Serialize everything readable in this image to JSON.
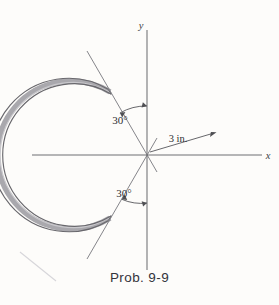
{
  "figure": {
    "caption": "Prob. 9-9",
    "background_color": "#fdfcfa",
    "axes": {
      "x_label": "x",
      "y_label": "y",
      "axis_color": "#6f6f72",
      "origin": {
        "x": 147,
        "y": 155
      }
    },
    "ring": {
      "radius_label": "3 in.",
      "radius_value": 3,
      "radius_units": "in.",
      "band_color": "#a9a8ad",
      "band_edge_color": "#68676c",
      "gap_total_degrees": 60,
      "geometry_radius_px": 74,
      "band_thickness_px": 5.4
    },
    "angles": [
      {
        "name": "upper-angle",
        "label": "30°",
        "value": 30,
        "units": "degrees",
        "measured_from": "y-axis",
        "direction": "counterclockwise"
      },
      {
        "name": "lower-angle",
        "label": "30°",
        "value": 30,
        "units": "degrees",
        "measured_from": "negative-y-axis",
        "direction": "clockwise"
      }
    ],
    "annotation_color": "#2e2e32"
  }
}
